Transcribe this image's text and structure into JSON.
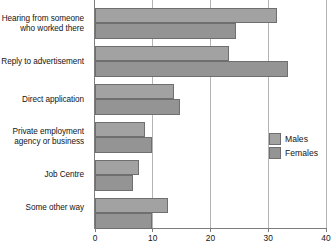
{
  "chart_data": {
    "type": "bar",
    "orientation": "horizontal",
    "title": "",
    "subtitle": "",
    "xlabel": "",
    "ylabel": "",
    "xlim": [
      0,
      40
    ],
    "xticks": [
      0,
      10,
      20,
      30,
      40
    ],
    "xtick_labels": [
      "0",
      "10",
      "20",
      "30",
      "40"
    ],
    "grid": "vertical",
    "legend_position": "middle-right",
    "categories": [
      "Hearing from someone\nwho worked there",
      "Reply to advertisement",
      "Direct application",
      "Private employment\nagency or business",
      "Job Centre",
      "Some other way"
    ],
    "series": [
      {
        "name": "Males",
        "color": "#a2a2a2",
        "values": [
          31.5,
          23.2,
          13.7,
          8.7,
          7.6,
          12.7
        ]
      },
      {
        "name": "Females",
        "color": "#949494",
        "values": [
          24.4,
          33.4,
          14.7,
          9.8,
          6.6,
          9.9
        ]
      }
    ]
  },
  "legend": {
    "items": [
      {
        "label": "Males"
      },
      {
        "label": "Females"
      }
    ]
  },
  "colors": {
    "males": "#a2a2a2",
    "females": "#949494",
    "grid": "#b4b4b4",
    "axis": "#7d7d7d",
    "text": "#141414",
    "background": "#ffffff"
  }
}
